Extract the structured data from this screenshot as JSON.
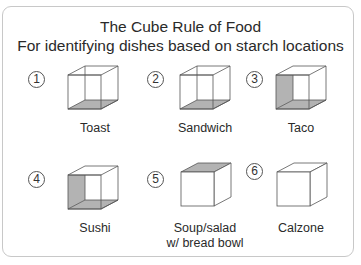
{
  "title": "The Cube Rule of Food",
  "subtitle": "For identifying dishes based on starch locations",
  "colors": {
    "starch_fill": "#b3b3b3",
    "line": "#555555",
    "border": "#c8c8c8"
  },
  "items": [
    {
      "number": "1",
      "label": "Toast",
      "label_line2": "",
      "starch_faces": [
        "bottom"
      ],
      "open": true
    },
    {
      "number": "2",
      "label": "Sandwich",
      "label_line2": "",
      "starch_faces": [
        "bottom"
      ],
      "open": true
    },
    {
      "number": "3",
      "label": "Taco",
      "label_line2": "",
      "starch_faces": [
        "left",
        "bottom"
      ],
      "open": true
    },
    {
      "number": "4",
      "label": "Sushi",
      "label_line2": "",
      "starch_faces": [
        "left",
        "bottom"
      ],
      "open": true
    },
    {
      "number": "5",
      "label": "Soup/salad",
      "label_line2": "w/ bread bowl",
      "starch_faces": [
        "top"
      ],
      "open": false
    },
    {
      "number": "6",
      "label": "Calzone",
      "label_line2": "",
      "starch_faces": [],
      "open": false
    }
  ]
}
